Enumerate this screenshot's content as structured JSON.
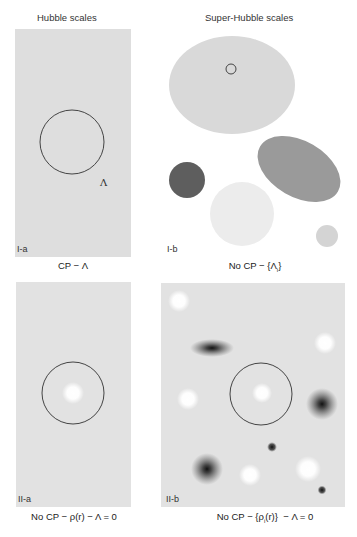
{
  "columns": {
    "left_heading": "Hubble scales",
    "right_heading": "Super-Hubble scales"
  },
  "panels": [
    {
      "id": "I-a",
      "label": "I-a",
      "caption": "CP − Λ",
      "annotation": "Λ",
      "background": "#dedede"
    },
    {
      "id": "I-b",
      "label": "I-b",
      "caption_prefix": "No CP − {Λ",
      "caption_sub": "i",
      "caption_suffix": "}",
      "background": "#ffffff"
    },
    {
      "id": "II-a",
      "label": "II-a",
      "caption": "No CP − ρ(r) − Λ = 0",
      "background": "#e2e2e2"
    },
    {
      "id": "II-b",
      "label": "II-b",
      "caption_prefix": "No CP − {ρ",
      "caption_sub": "i",
      "caption_suffix": "(r)}  − Λ = 0",
      "background": "#e2e2e2"
    }
  ],
  "colors": {
    "panel_gray": "#dedede",
    "large_ellipse": "#d9d9d9",
    "tilted_ellipse": "#9a9a9a",
    "dark_circle": "#5e5e5e",
    "light_circle": "#ececec",
    "small_circle": "#d4d4d4",
    "outline": "#444444"
  }
}
